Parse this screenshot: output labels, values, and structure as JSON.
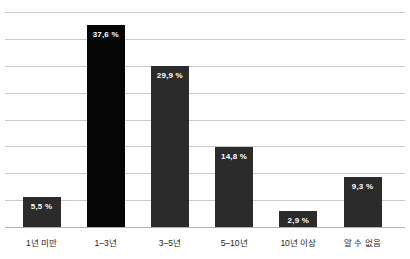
{
  "chart_data": {
    "type": "bar",
    "title": "",
    "subtitle": "",
    "xlabel": "",
    "ylabel": "",
    "ylim": [
      0,
      40
    ],
    "grid": true,
    "gridline_values": [
      40,
      35,
      30,
      25,
      20,
      15,
      10,
      5,
      0
    ],
    "legend": "none",
    "categories": [
      "1년 미만",
      "1–3년",
      "3–5년",
      "5–10년",
      "10년 이상",
      "알 수 없음"
    ],
    "values": [
      5.5,
      37.6,
      29.9,
      14.8,
      2.9,
      9.3
    ],
    "data_labels": [
      "5,5 %",
      "37,6 %",
      "29,9 %",
      "14,8 %",
      "2,9 %",
      "9,3 %"
    ],
    "bar_colors": [
      "#2b2b2b",
      "#050505",
      "#2b2b2b",
      "#2b2b2b",
      "#2b2b2b",
      "#2b2b2b"
    ],
    "colors": {
      "background": "#ffffff",
      "gridline": "#c9c9c9",
      "axis_line": "#b0b0b0",
      "bar_default": "#2b2b2b",
      "bar_highlight": "#050505",
      "data_label_text": "#ffffff",
      "category_label_text": "#1c1c1c"
    }
  }
}
